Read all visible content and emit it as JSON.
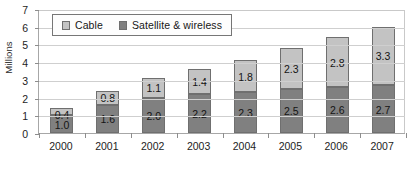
{
  "chart_data": {
    "type": "bar",
    "subtype": "stacked-vertical",
    "title": "",
    "xlabel": "",
    "ylabel": "Millions",
    "categories": [
      "2000",
      "2001",
      "2002",
      "2003",
      "2004",
      "2005",
      "2006",
      "2007"
    ],
    "series": [
      {
        "name": "Satellite & wireless",
        "color": "#808080",
        "values": [
          1.0,
          1.6,
          2.0,
          2.2,
          2.3,
          2.5,
          2.6,
          2.7
        ],
        "labels": [
          "1.0",
          "1.6",
          "2.0",
          "2.2",
          "2.3",
          "2.5",
          "2.6",
          "2.7"
        ]
      },
      {
        "name": "Cable",
        "color": "#c3c3c3",
        "values": [
          0.4,
          0.8,
          1.1,
          1.4,
          1.8,
          2.3,
          2.8,
          3.3
        ],
        "labels": [
          "0.4",
          "0.8",
          "1.1",
          "1.4",
          "1.8",
          "2.3",
          "2.8",
          "3.3"
        ]
      }
    ],
    "totals": [
      1.4,
      2.4,
      3.1,
      3.6,
      4.1,
      4.8,
      5.4,
      6.0
    ],
    "ylim": [
      0,
      7
    ],
    "ytick_labels": [
      "0",
      "1",
      "2",
      "3",
      "4",
      "5",
      "6",
      "7"
    ],
    "ytick_values": [
      0,
      1,
      2,
      3,
      4,
      5,
      6,
      7
    ],
    "grid": true,
    "grid_axis": "y",
    "legend_position": "top-left-inside",
    "legend_entries": [
      {
        "label": "Cable",
        "color": "#c3c3c3"
      },
      {
        "label": "Satellite & wireless",
        "color": "#808080"
      }
    ],
    "stack_order_bottom_to_top": [
      "Satellite & wireless",
      "Cable"
    ],
    "colors": {
      "cable": "#c3c3c3",
      "satellite_wireless": "#808080",
      "gridline": "#cfcfcf",
      "axis": "#a7a7a7",
      "plot_background": "#ffffff",
      "bar_border": "#6f6f6f",
      "text": "#1d1d1d"
    }
  }
}
